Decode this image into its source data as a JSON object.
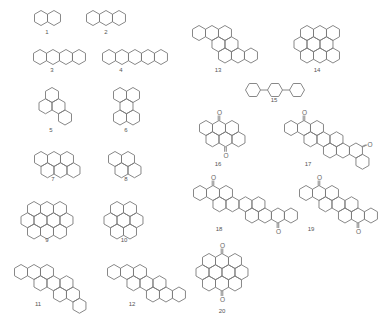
{
  "figure": {
    "hex_side": 7.5,
    "stroke_color": "#7a7a7a",
    "label_color": "#555555"
  },
  "compounds": [
    {
      "id": "1",
      "label": "1",
      "cx": 41,
      "cy": 18,
      "hexes": [
        [
          0,
          0
        ],
        [
          1,
          0
        ]
      ],
      "label_pos": [
        47,
        34
      ]
    },
    {
      "id": "2",
      "label": "2",
      "cx": 93,
      "cy": 18,
      "hexes": [
        [
          0,
          0
        ],
        [
          1,
          0
        ],
        [
          2,
          0
        ]
      ],
      "label_pos": [
        106,
        34
      ]
    },
    {
      "id": "3",
      "label": "3",
      "cx": 40,
      "cy": 57,
      "hexes": [
        [
          0,
          0
        ],
        [
          1,
          0
        ],
        [
          2,
          0
        ],
        [
          3,
          0
        ]
      ],
      "label_pos": [
        52,
        72
      ]
    },
    {
      "id": "4",
      "label": "4",
      "cx": 109,
      "cy": 57,
      "hexes": [
        [
          0,
          0
        ],
        [
          1,
          0
        ],
        [
          2,
          0
        ],
        [
          3,
          0
        ],
        [
          4,
          0
        ]
      ],
      "label_pos": [
        121,
        72
      ]
    },
    {
      "id": "5",
      "label": "5",
      "cx": 52,
      "cy": 95,
      "hexes": [
        [
          0,
          0
        ],
        [
          -1,
          1
        ],
        [
          0,
          1
        ],
        [
          0,
          2
        ]
      ],
      "label_pos": [
        51,
        132
      ]
    },
    {
      "id": "6",
      "label": "6",
      "cx": 120,
      "cy": 95,
      "hexes": [
        [
          0,
          0
        ],
        [
          1,
          0
        ],
        [
          0,
          1
        ],
        [
          -1,
          2
        ],
        [
          0,
          2
        ]
      ],
      "label_pos": [
        126,
        132
      ]
    },
    {
      "id": "7",
      "label": "7",
      "cx": 41,
      "cy": 159,
      "hexes": [
        [
          0,
          0
        ],
        [
          1,
          0
        ],
        [
          2,
          0
        ],
        [
          0,
          1
        ],
        [
          1,
          1
        ],
        [
          2,
          1
        ]
      ],
      "label_pos": [
        53,
        181
      ]
    },
    {
      "id": "8",
      "label": "8",
      "cx": 115,
      "cy": 159,
      "hexes": [
        [
          0,
          0
        ],
        [
          1,
          0
        ],
        [
          0,
          1
        ],
        [
          1,
          1
        ]
      ],
      "label_pos": [
        126,
        181
      ]
    },
    {
      "id": "9",
      "label": "9",
      "cx": 34,
      "cy": 209,
      "hexes": [
        [
          0,
          0
        ],
        [
          1,
          0
        ],
        [
          2,
          0
        ],
        [
          -1,
          1
        ],
        [
          0,
          1
        ],
        [
          1,
          1
        ],
        [
          2,
          1
        ],
        [
          -1,
          2
        ],
        [
          0,
          2
        ],
        [
          1,
          2
        ]
      ],
      "label_pos": [
        47,
        242
      ]
    },
    {
      "id": "10",
      "label": "10",
      "cx": 117,
      "cy": 209,
      "hexes": [
        [
          0,
          0
        ],
        [
          1,
          0
        ],
        [
          -1,
          1
        ],
        [
          0,
          1
        ],
        [
          1,
          1
        ],
        [
          -1,
          2
        ],
        [
          0,
          2
        ]
      ],
      "label_pos": [
        124,
        242
      ]
    },
    {
      "id": "11",
      "label": "11",
      "cx": 21,
      "cy": 272,
      "hexes": [
        [
          0,
          0
        ],
        [
          1,
          0
        ],
        [
          2,
          0
        ],
        [
          1,
          1
        ],
        [
          2,
          1
        ],
        [
          3,
          1
        ],
        [
          2,
          2
        ],
        [
          3,
          2
        ],
        [
          3,
          3
        ]
      ],
      "label_pos": [
        38,
        306
      ]
    },
    {
      "id": "12",
      "label": "12",
      "cx": 114,
      "cy": 272,
      "hexes": [
        [
          0,
          0
        ],
        [
          1,
          0
        ],
        [
          2,
          0
        ],
        [
          1,
          1
        ],
        [
          2,
          1
        ],
        [
          3,
          1
        ],
        [
          2,
          2
        ],
        [
          3,
          2
        ],
        [
          4,
          2
        ]
      ],
      "label_pos": [
        132,
        306
      ]
    },
    {
      "id": "13",
      "label": "13",
      "cx": 199,
      "cy": 33,
      "hexes": [
        [
          0,
          0
        ],
        [
          1,
          0
        ],
        [
          2,
          0
        ],
        [
          1,
          1
        ],
        [
          2,
          1
        ],
        [
          1,
          2
        ],
        [
          2,
          2
        ],
        [
          3,
          2
        ]
      ],
      "label_pos": [
        218,
        72
      ]
    },
    {
      "id": "14",
      "label": "14",
      "cx": 307,
      "cy": 33,
      "hexes": [
        [
          0,
          0
        ],
        [
          1,
          0
        ],
        [
          2,
          0
        ],
        [
          -1,
          1
        ],
        [
          0,
          1
        ],
        [
          1,
          1
        ],
        [
          -1,
          2
        ],
        [
          0,
          2
        ],
        [
          1,
          2
        ]
      ],
      "label_pos": [
        317,
        72
      ]
    },
    {
      "id": "15",
      "label": "15",
      "cx": 253,
      "cy": 90,
      "biphenyl": true,
      "rings": 3,
      "spacing": 22,
      "label_pos": [
        274,
        102
      ]
    },
    {
      "id": "16",
      "label": "16",
      "cx": 206,
      "cy": 128,
      "hexes": [
        [
          0,
          0
        ],
        [
          1,
          0
        ],
        [
          2,
          0
        ],
        [
          0,
          1
        ],
        [
          1,
          1
        ],
        [
          2,
          1
        ]
      ],
      "oxygens": [
        [
          1,
          0,
          "top"
        ],
        [
          1,
          1,
          "bottom"
        ]
      ],
      "label_pos": [
        218,
        166
      ]
    },
    {
      "id": "17",
      "label": "17",
      "cx": 291,
      "cy": 128,
      "hexes": [
        [
          0,
          0
        ],
        [
          1,
          0
        ],
        [
          2,
          0
        ],
        [
          1,
          1
        ],
        [
          2,
          1
        ],
        [
          3,
          1
        ],
        [
          2,
          2
        ],
        [
          3,
          2
        ],
        [
          4,
          2
        ],
        [
          4,
          3
        ]
      ],
      "oxygens": [
        [
          1,
          0,
          "top"
        ],
        [
          4,
          2,
          "right"
        ]
      ],
      "label_pos": [
        308,
        166
      ]
    },
    {
      "id": "18",
      "label": "18",
      "cx": 200,
      "cy": 193,
      "hexes": [
        [
          0,
          0
        ],
        [
          1,
          0
        ],
        [
          2,
          0
        ],
        [
          1,
          1
        ],
        [
          2,
          1
        ],
        [
          3,
          1
        ],
        [
          4,
          1
        ],
        [
          3,
          2
        ],
        [
          4,
          2
        ],
        [
          5,
          2
        ],
        [
          6,
          2
        ]
      ],
      "oxygens": [
        [
          1,
          0,
          "top"
        ],
        [
          5,
          2,
          "bottom"
        ]
      ],
      "label_pos": [
        219,
        231
      ]
    },
    {
      "id": "19",
      "label": "19",
      "cx": 306,
      "cy": 193,
      "hexes": [
        [
          0,
          0
        ],
        [
          1,
          0
        ],
        [
          2,
          0
        ],
        [
          1,
          1
        ],
        [
          2,
          1
        ],
        [
          3,
          1
        ],
        [
          2,
          2
        ],
        [
          3,
          2
        ],
        [
          4,
          2
        ]
      ],
      "oxygens": [
        [
          1,
          0,
          "top"
        ],
        [
          3,
          2,
          "bottom"
        ]
      ],
      "label_pos": [
        311,
        231
      ]
    },
    {
      "id": "20",
      "label": "20",
      "cx": 209,
      "cy": 261,
      "hexes": [
        [
          0,
          0
        ],
        [
          1,
          0
        ],
        [
          2,
          0
        ],
        [
          -1,
          1
        ],
        [
          0,
          1
        ],
        [
          1,
          1
        ],
        [
          2,
          1
        ],
        [
          -1,
          2
        ],
        [
          0,
          2
        ],
        [
          1,
          2
        ]
      ],
      "oxygens": [
        [
          1,
          0,
          "top"
        ],
        [
          0,
          2,
          "bottom"
        ]
      ],
      "label_pos": [
        222,
        313
      ]
    }
  ]
}
